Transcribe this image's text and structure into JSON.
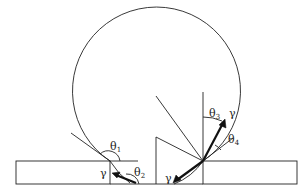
{
  "figure": {
    "labels": {
      "theta1": "θ",
      "theta1_sub": "1",
      "theta2": "θ",
      "theta2_sub": "2",
      "theta3": "θ",
      "theta3_sub": "3",
      "theta4": "θ",
      "theta4_sub": "4",
      "gamma_left": "γ",
      "gamma_bottom": "γ",
      "gamma_right": "γ"
    },
    "colors": {
      "stroke": "#222222",
      "background": "#ffffff"
    }
  }
}
